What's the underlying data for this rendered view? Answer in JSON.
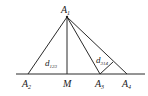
{
  "diagram": {
    "points": {
      "A1": {
        "label": "A",
        "sub": "1",
        "x": 67,
        "y": 17
      },
      "A2": {
        "label": "A",
        "sub": "2",
        "x": 28,
        "y": 74
      },
      "M": {
        "label": "M",
        "sub": "",
        "x": 67,
        "y": 74
      },
      "A3": {
        "label": "A",
        "sub": "3",
        "x": 100,
        "y": 74
      },
      "A4": {
        "label": "A",
        "sub": "4",
        "x": 127,
        "y": 74
      },
      "F": {
        "x": 113,
        "y": 62
      }
    },
    "labels": {
      "A1": {
        "main": "A",
        "sub": "1"
      },
      "A2": {
        "main": "A",
        "sub": "2"
      },
      "M": {
        "main": "M"
      },
      "A3": {
        "main": "A",
        "sub": "3"
      },
      "A4": {
        "main": "A",
        "sub": "4"
      },
      "d123": {
        "main": "d",
        "sub": "123"
      },
      "d314": {
        "main": "d",
        "sub": "314"
      }
    },
    "line_color": "#2a2a2a"
  }
}
